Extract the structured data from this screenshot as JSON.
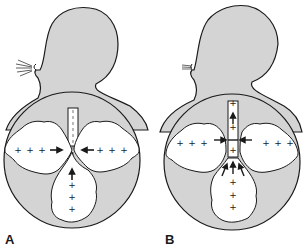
{
  "figure": {
    "panels": [
      {
        "label": "A",
        "description": "Person exhaling; airway remains open, alveolar pressure (+) and arrows pointing toward airway",
        "plus_signs_per_lobe": 3,
        "breath_lines": 5
      },
      {
        "label": "B",
        "description": "Forced expiration; airway compressed by surrounding pressure, arrows showing airflow up trachea",
        "plus_signs_per_lobe": 3,
        "breath_lines": 3
      }
    ],
    "colors": {
      "body_fill": "#d4d4d4",
      "outline": "#1a1a1a",
      "lung_fill": "#ffffff",
      "background": "#ffffff"
    }
  }
}
